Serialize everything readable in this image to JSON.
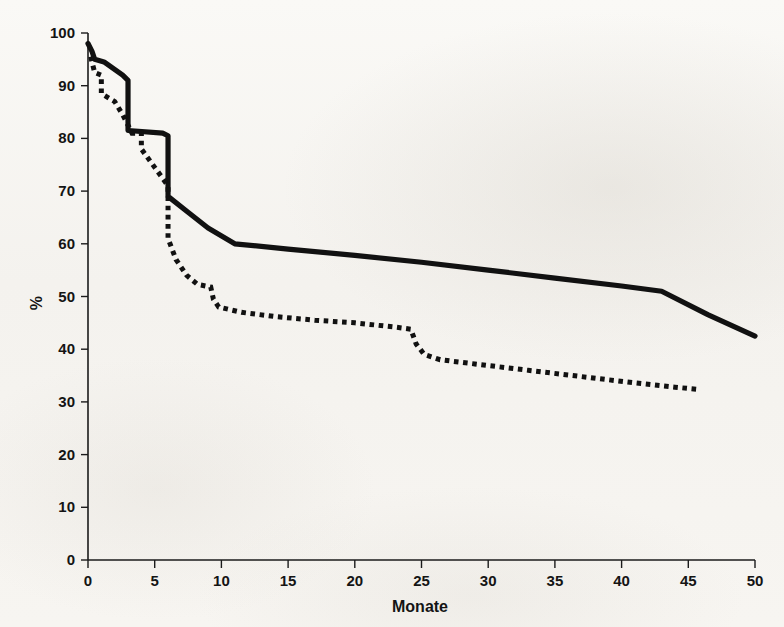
{
  "chart_data": {
    "type": "line",
    "title": "",
    "subtitle": "",
    "xlabel": "Monate",
    "ylabel": "%",
    "xlim": [
      0,
      50
    ],
    "ylim": [
      0,
      100
    ],
    "x_ticks": [
      0,
      5,
      10,
      15,
      20,
      25,
      30,
      35,
      40,
      45,
      50
    ],
    "y_ticks": [
      0,
      10,
      20,
      30,
      40,
      50,
      60,
      70,
      80,
      90,
      100
    ],
    "x_tick_labels": [
      "0",
      "5",
      "10",
      "15",
      "20",
      "25",
      "30",
      "35",
      "40",
      "45",
      "50"
    ],
    "y_tick_labels": [
      "0",
      "10",
      "20",
      "30",
      "40",
      "50",
      "60",
      "70",
      "80",
      "90",
      "100"
    ],
    "grid": false,
    "legend": "none",
    "legend_position": "none",
    "axis_color": "#111111",
    "series": [
      {
        "name": "solid-curve",
        "style": "solid",
        "color": "#111111",
        "points": [
          [
            0.0,
            98.0
          ],
          [
            0.3,
            96.5
          ],
          [
            0.5,
            95.0
          ],
          [
            1.2,
            94.5
          ],
          [
            2.6,
            92.0
          ],
          [
            3.0,
            91.0
          ],
          [
            3.0,
            81.5
          ],
          [
            5.6,
            81.0
          ],
          [
            6.0,
            80.5
          ],
          [
            6.0,
            69.0
          ],
          [
            7.5,
            66.0
          ],
          [
            9.0,
            63.0
          ],
          [
            11.0,
            60.0
          ],
          [
            15.0,
            59.0
          ],
          [
            20.0,
            57.8
          ],
          [
            25.0,
            56.5
          ],
          [
            30.0,
            55.0
          ],
          [
            35.0,
            53.5
          ],
          [
            40.0,
            52.0
          ],
          [
            43.0,
            51.0
          ],
          [
            46.5,
            46.5
          ],
          [
            50.0,
            42.5
          ]
        ]
      },
      {
        "name": "dotted-curve",
        "style": "dotted",
        "color": "#111111",
        "points": [
          [
            0.2,
            95.5
          ],
          [
            0.5,
            92.5
          ],
          [
            1.0,
            92.0
          ],
          [
            1.0,
            88.5
          ],
          [
            2.0,
            87.0
          ],
          [
            2.6,
            84.5
          ],
          [
            3.0,
            82.5
          ],
          [
            3.3,
            81.0
          ],
          [
            4.0,
            81.0
          ],
          [
            4.0,
            78.0
          ],
          [
            5.0,
            74.5
          ],
          [
            6.0,
            71.0
          ],
          [
            6.0,
            61.0
          ],
          [
            6.6,
            57.0
          ],
          [
            7.4,
            54.0
          ],
          [
            8.2,
            52.3
          ],
          [
            9.2,
            51.8
          ],
          [
            9.4,
            49.5
          ],
          [
            9.8,
            48.0
          ],
          [
            11.5,
            47.0
          ],
          [
            14.0,
            46.2
          ],
          [
            17.0,
            45.5
          ],
          [
            20.0,
            45.0
          ],
          [
            23.0,
            44.2
          ],
          [
            24.2,
            43.8
          ],
          [
            24.6,
            41.0
          ],
          [
            25.2,
            39.0
          ],
          [
            26.4,
            38.0
          ],
          [
            29.0,
            37.2
          ],
          [
            33.0,
            36.0
          ],
          [
            37.0,
            34.8
          ],
          [
            41.0,
            33.6
          ],
          [
            44.0,
            32.8
          ],
          [
            45.6,
            32.4
          ]
        ]
      }
    ]
  },
  "figure": {
    "background_color": "#f7f6f3",
    "ink_color": "#111111"
  }
}
